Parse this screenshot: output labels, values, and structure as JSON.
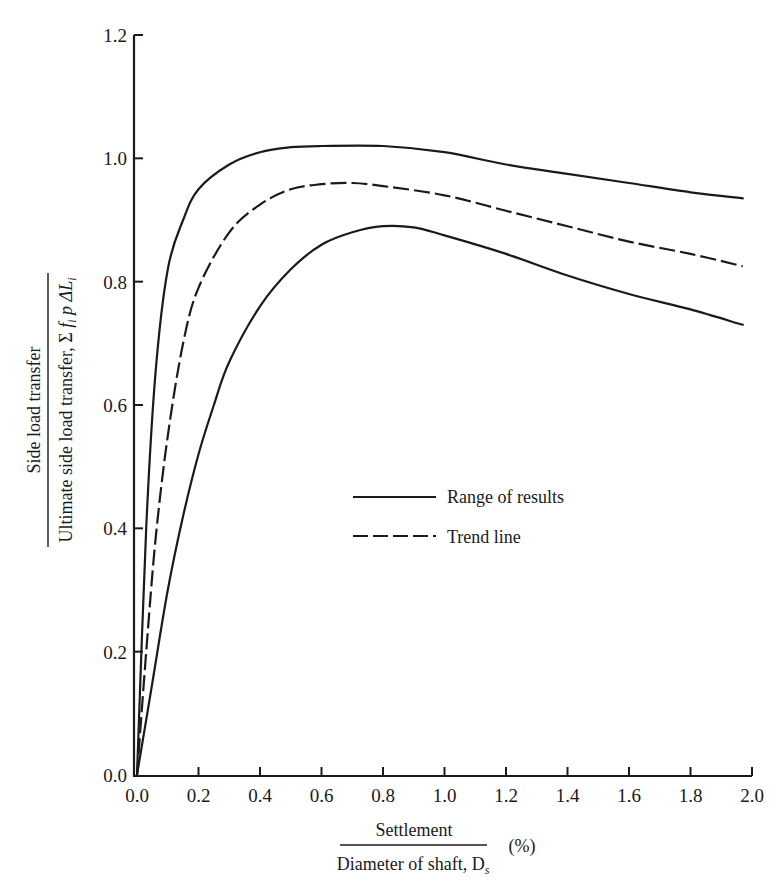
{
  "chart_data": {
    "type": "line",
    "title": "",
    "xlabel": {
      "numerator": "Settlement",
      "denominator": "Diameter of shaft, D",
      "denominator_subscript": "s",
      "unit": "(%)"
    },
    "ylabel": {
      "numerator": "Side load transfer",
      "denominator": "Ultimate side load transfer, Σ fᵢ p ΔLᵢ",
      "denominator_prefix": "Ultimate side load transfer, Σ",
      "denominator_f": "f",
      "denominator_p": " p ΔL"
    },
    "xlim": [
      0.0,
      2.0
    ],
    "ylim": [
      0.0,
      1.2
    ],
    "x_ticks": [
      "0.0",
      "0.2",
      "0.4",
      "0.6",
      "0.8",
      "1.0",
      "1.2",
      "1.4",
      "1.6",
      "1.8",
      "2.0"
    ],
    "y_ticks": [
      "0.0",
      "0.2",
      "0.4",
      "0.6",
      "0.8",
      "1.0",
      "1.2"
    ],
    "grid": false,
    "legend_position": "center",
    "legend": [
      {
        "label": "Range of results",
        "style": "solid"
      },
      {
        "label": "Trend line",
        "style": "dashed"
      }
    ],
    "series": [
      {
        "name": "Range of results (upper bound)",
        "style": "solid",
        "x": [
          0.0,
          0.03,
          0.06,
          0.1,
          0.15,
          0.2,
          0.3,
          0.4,
          0.5,
          0.6,
          0.8,
          1.0,
          1.2,
          1.4,
          1.6,
          1.8,
          1.97
        ],
        "y": [
          0.0,
          0.4,
          0.65,
          0.82,
          0.9,
          0.95,
          0.99,
          1.01,
          1.018,
          1.02,
          1.02,
          1.01,
          0.99,
          0.975,
          0.96,
          0.945,
          0.935
        ]
      },
      {
        "name": "Trend line",
        "style": "dashed",
        "x": [
          0.0,
          0.03,
          0.06,
          0.1,
          0.15,
          0.2,
          0.3,
          0.4,
          0.5,
          0.6,
          0.7,
          0.8,
          1.0,
          1.2,
          1.4,
          1.6,
          1.8,
          1.97
        ],
        "y": [
          0.0,
          0.2,
          0.38,
          0.55,
          0.7,
          0.79,
          0.88,
          0.925,
          0.95,
          0.958,
          0.96,
          0.955,
          0.94,
          0.915,
          0.89,
          0.865,
          0.845,
          0.825
        ]
      },
      {
        "name": "Range of results (lower bound)",
        "style": "solid",
        "x": [
          0.0,
          0.05,
          0.1,
          0.15,
          0.2,
          0.25,
          0.3,
          0.4,
          0.5,
          0.6,
          0.7,
          0.8,
          0.9,
          1.0,
          1.2,
          1.4,
          1.6,
          1.8,
          1.97
        ],
        "y": [
          0.0,
          0.15,
          0.3,
          0.42,
          0.52,
          0.6,
          0.67,
          0.76,
          0.82,
          0.86,
          0.88,
          0.89,
          0.888,
          0.875,
          0.845,
          0.81,
          0.78,
          0.755,
          0.73
        ]
      }
    ]
  }
}
